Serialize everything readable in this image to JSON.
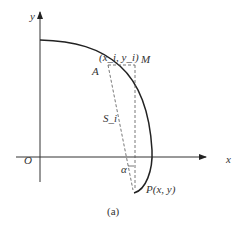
{
  "diagram": {
    "axes": {
      "x_label": "x",
      "y_label": "y",
      "origin_label": "O"
    },
    "points": {
      "A": {
        "label": "A",
        "coord_label": "(x_i, y_i)"
      },
      "M": {
        "label": "M"
      },
      "P": {
        "label": "P(x, y)"
      }
    },
    "segment_label": "S_i",
    "angle_label": "α",
    "caption": "(a)",
    "colors": {
      "stroke": "#222222",
      "dashed": "#555555"
    }
  }
}
